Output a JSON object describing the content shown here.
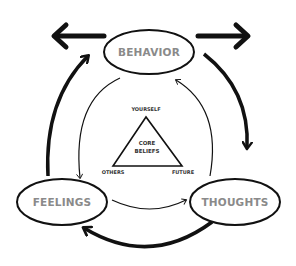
{
  "diagram": {
    "type": "cognitive-triangle-cycle",
    "nodes": {
      "behavior": "BEHAVIOR",
      "thoughts": "THOUGHTS",
      "feelings": "FEELINGS"
    },
    "core": {
      "line1": "CORE",
      "line2": "BELIEFS",
      "vertices": {
        "top": "YOURSELF",
        "left": "OTHERS",
        "right": "FUTURE"
      }
    },
    "edges": [
      {
        "from": "behavior",
        "to": "thoughts",
        "style": "outer-thick"
      },
      {
        "from": "thoughts",
        "to": "feelings",
        "style": "outer-thick"
      },
      {
        "from": "feelings",
        "to": "behavior",
        "style": "outer-thick"
      },
      {
        "from": "behavior",
        "to": "feelings",
        "style": "inner-thin"
      },
      {
        "from": "feelings",
        "to": "thoughts",
        "style": "inner-thin"
      },
      {
        "from": "thoughts",
        "to": "behavior",
        "style": "inner-thin"
      },
      {
        "from": "behavior",
        "to": "left-out",
        "style": "outward-thick"
      },
      {
        "from": "behavior",
        "to": "right-out",
        "style": "outward-thick"
      }
    ],
    "colors": {
      "stroke": "#111111",
      "label": "#8a8a8a",
      "background": "#ffffff"
    }
  }
}
